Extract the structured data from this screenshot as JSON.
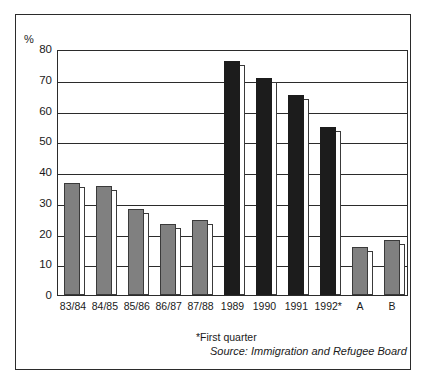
{
  "figure": {
    "y_unit_label": "%",
    "footnote_first_quarter": "*First quarter",
    "footnote_source": "Source: Immigration and Refugee Board"
  },
  "colors": {
    "bar_gray": "#808080",
    "bar_black": "#1c1c1c",
    "axis": "#2b2b2b",
    "background": "#ffffff"
  },
  "chart_data": {
    "type": "bar",
    "title": "",
    "subtitle": "",
    "xlabel": "",
    "ylabel": "%",
    "ylim": [
      0,
      80
    ],
    "yticks": [
      0,
      10,
      20,
      30,
      40,
      50,
      60,
      70,
      80
    ],
    "ytick_labels": [
      "0",
      "10",
      "20",
      "30",
      "40",
      "50",
      "60",
      "70",
      "80"
    ],
    "grid": true,
    "grid_axis": "y",
    "legend": false,
    "legend_position": "none",
    "categories": [
      "83/84",
      "84/85",
      "85/86",
      "86/87",
      "87/88",
      "1989",
      "1990",
      "1991",
      "1992*",
      "A",
      "B"
    ],
    "values": [
      36.5,
      35.5,
      28,
      23,
      24.5,
      76,
      70.5,
      65,
      54.5,
      15.5,
      18
    ],
    "bar_colors": [
      "gray",
      "gray",
      "gray",
      "gray",
      "gray",
      "black",
      "black",
      "black",
      "black",
      "gray",
      "gray"
    ],
    "annotations": [
      "*First quarter",
      "Source: Immigration and Refugee Board"
    ]
  }
}
